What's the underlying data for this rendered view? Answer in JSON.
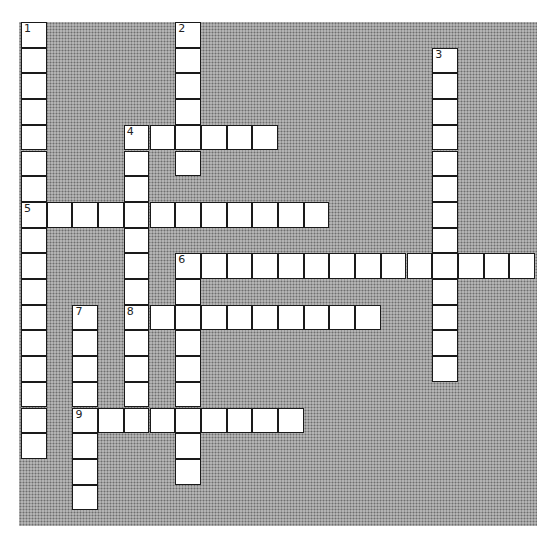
{
  "puzzle": {
    "type": "crossword",
    "cell_size_px": 25.7,
    "origin_px": [
      21,
      22
    ],
    "colors": {
      "cell": "#ffffff",
      "border": "#1a1a1a",
      "background_pattern": "#a9a9a9"
    },
    "entries": [
      {
        "number": "1",
        "direction": "down",
        "row": 0,
        "col": 0,
        "length": 17
      },
      {
        "number": "2",
        "direction": "down",
        "row": 0,
        "col": 6,
        "length": 6
      },
      {
        "number": "3",
        "direction": "down",
        "row": 1,
        "col": 16,
        "length": 13
      },
      {
        "number": "4",
        "direction": "across",
        "row": 4,
        "col": 4,
        "length": 6
      },
      {
        "number": "4",
        "direction": "down",
        "row": 4,
        "col": 4,
        "length": 11
      },
      {
        "number": "5",
        "direction": "across",
        "row": 7,
        "col": 0,
        "length": 12
      },
      {
        "number": "6",
        "direction": "across",
        "row": 9,
        "col": 6,
        "length": 14
      },
      {
        "number": "6",
        "direction": "down",
        "row": 9,
        "col": 6,
        "length": 9
      },
      {
        "number": "7",
        "direction": "down",
        "row": 11,
        "col": 2,
        "length": 8
      },
      {
        "number": "8",
        "direction": "across",
        "row": 11,
        "col": 4,
        "length": 10
      },
      {
        "number": "9",
        "direction": "across",
        "row": 15,
        "col": 2,
        "length": 9
      }
    ]
  }
}
